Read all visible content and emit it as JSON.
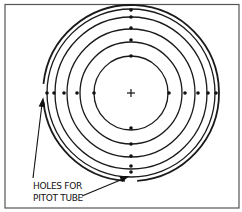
{
  "diagram": {
    "label_line1": "HOLES FOR",
    "label_line2": "PITOT TUBE",
    "center_symbol": "+",
    "colors": {
      "stroke": "#1a1a1a",
      "frame": "#555555",
      "background": "#ffffff"
    },
    "center": {
      "x": 131,
      "y": 93
    },
    "circle_radii": [
      37,
      51,
      64,
      76,
      84
    ],
    "outer_radius": 88,
    "dots": {
      "top_y": [
        10,
        17,
        28,
        40,
        56
      ],
      "bottom_y": [
        128,
        144,
        156,
        166,
        172
      ],
      "left_x": [
        47,
        54,
        64,
        77,
        94
      ],
      "right_x": [
        169,
        185,
        198,
        208,
        216
      ]
    }
  }
}
